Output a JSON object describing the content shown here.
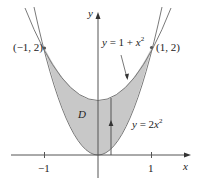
{
  "figure": {
    "type": "region-between-curves",
    "region_label": "D",
    "axes": {
      "x_label": "x",
      "y_label": "y",
      "x_ticks": [
        {
          "value": -1,
          "label": "−1"
        },
        {
          "value": 1,
          "label": "1"
        }
      ]
    },
    "curves": [
      {
        "name": "upper",
        "equation": "y = 1 + x²",
        "label_prefix": "y = 1 + ",
        "label_var": "x",
        "label_exp": "2"
      },
      {
        "name": "lower",
        "equation": "y = 2x²",
        "label_prefix": "y = 2",
        "label_var": "x",
        "label_exp": "2"
      }
    ],
    "points": [
      {
        "x": -1,
        "y": 2,
        "label": "(−1, 2)"
      },
      {
        "x": 1,
        "y": 2,
        "label": "(1, 2)"
      }
    ],
    "colors": {
      "region_fill": "#c8c8c8",
      "curve_stroke": "#7a7a7a",
      "axis_stroke": "#555555",
      "text": "#222222"
    }
  }
}
